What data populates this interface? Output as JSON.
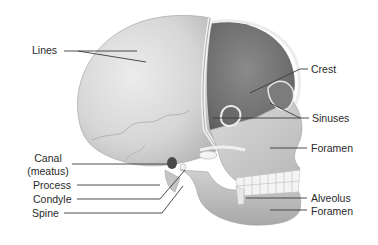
{
  "diagram": {
    "colors": {
      "background": "#ffffff",
      "bone_light": "#e4e4e4",
      "bone_mid": "#c8c8c8",
      "bone_dark": "#8e8e8e",
      "cavity": "#7a7a7a",
      "leader_line": "#3a3a3a",
      "label_text": "#2a2a2a"
    },
    "labels_left": [
      {
        "id": "lines",
        "text": "Lines"
      },
      {
        "id": "canal",
        "text": "Canal"
      },
      {
        "id": "canal_sub",
        "text": "(meatus)"
      },
      {
        "id": "process",
        "text": "Process"
      },
      {
        "id": "condyle",
        "text": "Condyle"
      },
      {
        "id": "spine",
        "text": "Spine"
      }
    ],
    "labels_right": [
      {
        "id": "crest",
        "text": "Crest"
      },
      {
        "id": "sinuses",
        "text": "Sinuses"
      },
      {
        "id": "foramen_upper",
        "text": "Foramen"
      },
      {
        "id": "alveolus",
        "text": "Alveolus"
      },
      {
        "id": "foramen_lower",
        "text": "Foramen"
      }
    ]
  }
}
